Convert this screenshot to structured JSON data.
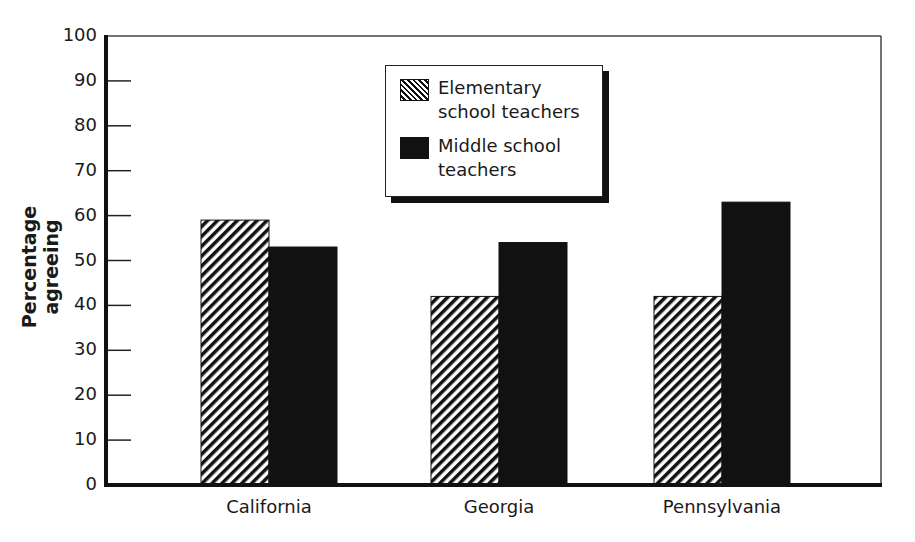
{
  "chart_data": {
    "type": "bar",
    "title": "",
    "xlabel": "",
    "ylabel": "Percentage agreeing",
    "ylim": [
      0,
      100
    ],
    "yticks": [
      0,
      10,
      20,
      30,
      40,
      50,
      60,
      70,
      80,
      90,
      100
    ],
    "categories": [
      "California",
      "Georgia",
      "Pennsylvania"
    ],
    "series": [
      {
        "name": "Elementary school teachers",
        "pattern": "hatched",
        "values": [
          59,
          42,
          42
        ]
      },
      {
        "name": "Middle school teachers",
        "pattern": "solid",
        "color": "#111111",
        "values": [
          53,
          54,
          63
        ]
      }
    ],
    "grid": false,
    "legend_position": "top-center (inside plot)"
  },
  "legend": {
    "items": [
      {
        "line1": "Elementary",
        "line2": "school teachers"
      },
      {
        "line1": "Middle school",
        "line2": "teachers"
      }
    ]
  }
}
